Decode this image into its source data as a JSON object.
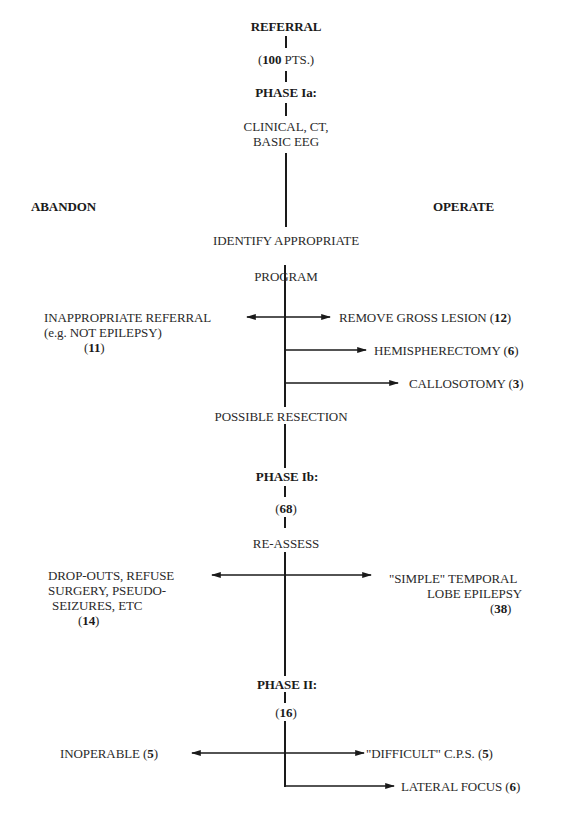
{
  "diagram": {
    "type": "flowchart",
    "side_labels": {
      "left": "ABANDON",
      "right": "OPERATE"
    },
    "spine": [
      {
        "id": "referral",
        "text": "REFERRAL",
        "bold": true
      },
      {
        "id": "referral_count",
        "open": "(",
        "count": "100",
        "rest": " PTS.)"
      },
      {
        "id": "phase_ia",
        "text": "PHASE Ia:",
        "bold": true
      },
      {
        "id": "clinical",
        "lines": [
          "CLINICAL, CT,",
          "BASIC EEG"
        ]
      },
      {
        "id": "identify",
        "text": "IDENTIFY APPROPRIATE"
      },
      {
        "id": "program",
        "text": "PROGRAM"
      },
      {
        "id": "possible_resection",
        "text": "POSSIBLE RESECTION"
      },
      {
        "id": "phase_ib",
        "text": "PHASE Ib:",
        "bold": true
      },
      {
        "id": "phase_ib_count",
        "open": "(",
        "count": "68",
        "close": ")"
      },
      {
        "id": "reassess",
        "text": "RE-ASSESS"
      },
      {
        "id": "phase_ii",
        "text": "PHASE II:",
        "bold": true
      },
      {
        "id": "phase_ii_count",
        "open": "(",
        "count": "16",
        "close": ")"
      }
    ],
    "branches": {
      "inappropriate": {
        "lines": [
          "INAPPROPRIATE REFERRAL",
          "(e.g. NOT EPILEPSY)"
        ],
        "count": "11",
        "direction": "left"
      },
      "gross_lesion": {
        "text": "REMOVE GROSS LESION",
        "count": "12",
        "direction": "right"
      },
      "hemispherectomy": {
        "text": "HEMISPHERECTOMY",
        "count": "6",
        "direction": "right"
      },
      "callosotomy": {
        "text": "CALLOSOTOMY",
        "count": "3",
        "direction": "right"
      },
      "dropouts": {
        "lines": [
          "DROP-OUTS, REFUSE",
          "SURGERY, PSEUDO-",
          "SEIZURES, ETC"
        ],
        "count": "14",
        "direction": "left"
      },
      "simple_tle": {
        "lines": [
          "\"SIMPLE\" TEMPORAL",
          "LOBE EPILEPSY"
        ],
        "count": "38",
        "direction": "right"
      },
      "inoperable": {
        "text": "INOPERABLE",
        "count": "5",
        "direction": "left"
      },
      "difficult_cps": {
        "text": "\"DIFFICULT\" C.P.S.",
        "count": "5",
        "direction": "right"
      },
      "lateral_focus": {
        "text": "LATERAL FOCUS",
        "count": "6",
        "direction": "right"
      }
    },
    "punct": {
      "open": " (",
      "close": ")",
      "open_nospace": "("
    }
  }
}
